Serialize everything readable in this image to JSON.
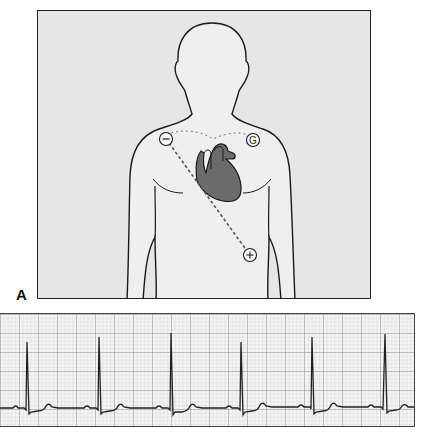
{
  "figure": {
    "panel_label": "A",
    "diagram": {
      "subject": "human torso outline with heart",
      "electrodes": [
        {
          "name": "negative-electrode",
          "symbol": "−",
          "x": 165,
          "y": 138
        },
        {
          "name": "ground-electrode",
          "symbol": "G",
          "x": 252,
          "y": 139
        },
        {
          "name": "positive-electrode",
          "symbol": "+",
          "x": 249,
          "y": 254
        }
      ],
      "lead_line": "dashed line from negative (right shoulder) to positive (lower left chest)",
      "ground_line": "dotted line across clavicles"
    },
    "ecg": {
      "grid": "small and large squares",
      "beats": 6,
      "qrs_x_positions": [
        27,
        99,
        171,
        241,
        312,
        385
      ],
      "rhythm": "regular"
    }
  },
  "colors": {
    "panel_bg": "#e6e6e6",
    "body_fill": "#efefef",
    "outline": "#1a1a1a",
    "heart_fill": "#6b6b6b",
    "grid_minor": "#c8c8c8",
    "grid_major": "#8a8a8a",
    "trace": "#222222"
  }
}
